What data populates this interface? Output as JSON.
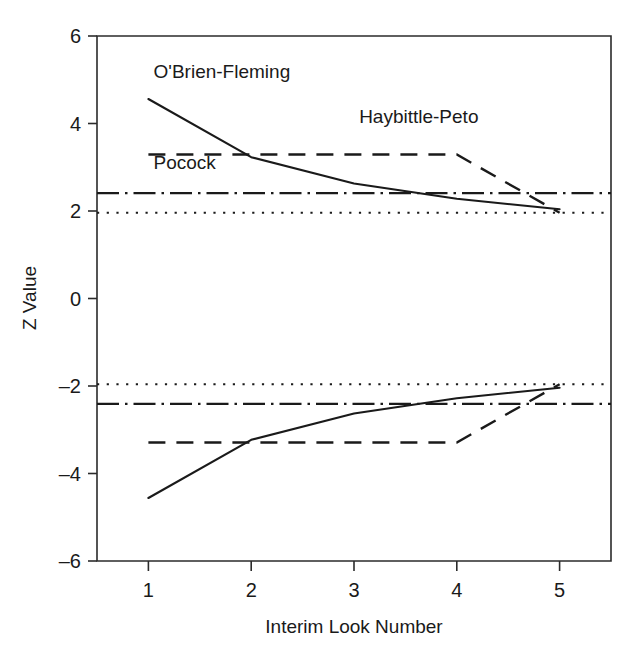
{
  "chart_data": {
    "type": "line",
    "title": "",
    "xlabel": "Interim Look Number",
    "ylabel": "Z Value",
    "xlim": [
      0.5,
      5.5
    ],
    "ylim": [
      -6,
      6
    ],
    "grid": false,
    "legend_position": "inline-annotations",
    "x": [
      1,
      2,
      3,
      4,
      5
    ],
    "xticks": [
      "1",
      "2",
      "3",
      "4",
      "5"
    ],
    "yticks": [
      "6",
      "4",
      "2",
      "0",
      "-2",
      "-4",
      "-6"
    ],
    "ytick_values": [
      6,
      4,
      2,
      0,
      -2,
      -4,
      -6
    ],
    "series": [
      {
        "name": "O'Brien-Fleming",
        "style": "solid",
        "values": [
          4.56,
          3.23,
          2.63,
          2.28,
          2.04
        ]
      },
      {
        "name": "O'Brien-Fleming (lower)",
        "style": "solid",
        "values": [
          -4.56,
          -3.23,
          -2.63,
          -2.28,
          -2.04
        ]
      },
      {
        "name": "Haybittle-Peto",
        "style": "dashed",
        "values": [
          3.29,
          3.29,
          3.29,
          3.29,
          1.96
        ]
      },
      {
        "name": "Haybittle-Peto (lower)",
        "style": "dashed",
        "values": [
          -3.29,
          -3.29,
          -3.29,
          -3.29,
          -1.96
        ]
      },
      {
        "name": "Pocock",
        "style": "dashdot",
        "values": [
          2.41,
          2.41,
          2.41,
          2.41,
          2.41
        ]
      },
      {
        "name": "Pocock (lower)",
        "style": "dashdot",
        "values": [
          -2.41,
          -2.41,
          -2.41,
          -2.41,
          -2.41
        ]
      },
      {
        "name": "Fixed-sample",
        "style": "dotted",
        "values": [
          1.96,
          1.96,
          1.96,
          1.96,
          1.96
        ]
      },
      {
        "name": "Fixed-sample (lower)",
        "style": "dotted",
        "values": [
          -1.96,
          -1.96,
          -1.96,
          -1.96,
          -1.96
        ]
      }
    ],
    "annotations": [
      {
        "text": "O'Brien-Fleming",
        "x": 1.05,
        "y": 5.05
      },
      {
        "text": "Haybittle-Peto",
        "x": 3.05,
        "y": 4.02
      },
      {
        "text": "Pocock",
        "x": 1.05,
        "y": 2.95
      }
    ]
  },
  "axes": {
    "x_title": "Interim Look Number",
    "y_title": "Z Value"
  },
  "colors": {
    "ink": "#1a1a1a",
    "axis": "#2b2b2b",
    "background": "#ffffff"
  }
}
